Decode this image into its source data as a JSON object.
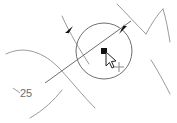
{
  "canvas": {
    "width": 177,
    "height": 123,
    "background": "#ffffff",
    "app_kind": "cad-drawing-viewport"
  },
  "colors": {
    "geometry_stroke": "#9a9a9a",
    "dimension_stroke": "#6e6e6e",
    "selection_circle": "#6e6e6e",
    "marker_fill": "#111111",
    "cursor_outline": "#222222",
    "cursor_fill": "#ffffff",
    "label_text": "#6e6e6e"
  },
  "dimension": {
    "name": "linear-dimension-25",
    "value_label": "25",
    "units": "",
    "line": {
      "x1": 45,
      "y1": 83,
      "x2": 131,
      "y2": 21
    },
    "arrow_start": {
      "x": 71,
      "y": 29,
      "direction": "up-right"
    },
    "arrow_end": {
      "x": 122,
      "y": 30,
      "direction": "down-left"
    },
    "label_position": {
      "x": 20,
      "y": 97
    },
    "leader": {
      "x1": 13,
      "y1": 88,
      "x2": 20,
      "y2": 93
    }
  },
  "selection": {
    "name": "selection-circle",
    "center": {
      "x": 104,
      "y": 51
    },
    "radius": 28,
    "grip_point": {
      "x": 104,
      "y": 51
    },
    "grip_size": 5
  },
  "cursor": {
    "name": "mouse-cursor",
    "x": 108,
    "y": 56,
    "type": "arrow-pointer"
  },
  "snap_marker": {
    "name": "snap-crosshair-marker",
    "x": 119,
    "y": 67,
    "size": 5
  },
  "geometry": {
    "curves": [
      {
        "name": "arc-left-upper",
        "path": "M 6,54 C 24,45 44,52 60,69 C 72,82 83,96 95,108"
      },
      {
        "name": "arc-left-lower-tail",
        "path": "M 30,118 C 44,110 54,100 62,90"
      },
      {
        "name": "extension-line-left",
        "path": "M 62,16 C 70,34 80,50 89,64"
      },
      {
        "name": "extension-line-right",
        "path": "M 117,4 C 126,13 136,24 146,34"
      },
      {
        "name": "arc-top-right",
        "path": "M 146,34 C 152,23 157,15 163,9"
      },
      {
        "name": "arc-right-descending",
        "path": "M 163,9 C 166,18 168,30 170,42"
      },
      {
        "name": "arc-bottom-right",
        "path": "M 151,60 C 158,71 164,82 170,94"
      }
    ]
  }
}
